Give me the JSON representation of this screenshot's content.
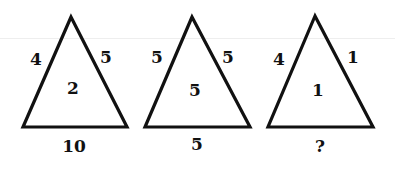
{
  "puzzle": {
    "triangles": [
      {
        "left": "4",
        "right": "5",
        "center": "2",
        "bottom": "10"
      },
      {
        "left": "5",
        "right": "5",
        "center": "5",
        "bottom": "5"
      },
      {
        "left": "4",
        "right": "1",
        "center": "1",
        "bottom": "?"
      }
    ],
    "stroke_color": "#111111"
  }
}
